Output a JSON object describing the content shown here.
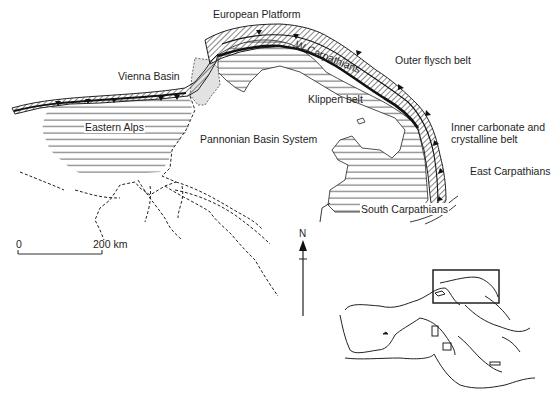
{
  "labels": {
    "european_platform": "European Platform",
    "w_carpathians": "W Carpathians",
    "outer_flysch_belt": "Outer flysch belt",
    "vienna_basin": "Vienna Basin",
    "klippen_belt": "Klippen belt",
    "eastern_alps": "Eastern Alps",
    "pannonian_basin_system": "Pannonian Basin System",
    "inner_carbonate_line1": "Inner carbonate and",
    "inner_carbonate_line2": "crystalline belt",
    "east_carpathians": "East Carpathians",
    "south_carpathians": "South Carpathians"
  },
  "scale_bar": {
    "start": "0",
    "end": "200 km"
  },
  "north_arrow": {
    "label": "N"
  },
  "inset": {
    "description": "Mediterranean overview with box around Carpathian-Pannonian region"
  },
  "colors": {
    "ink": "#1e1e1e",
    "vienna_fill": "#e2e2e2",
    "background": "#ffffff"
  }
}
